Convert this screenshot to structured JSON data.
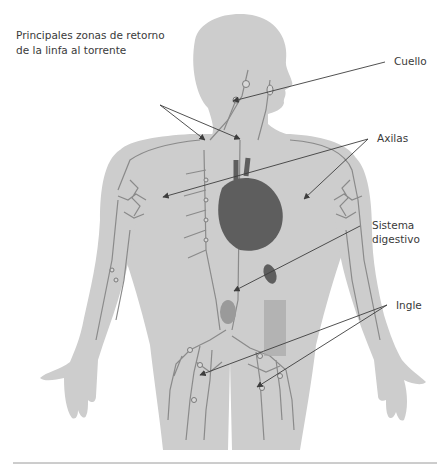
{
  "title": {
    "line1": "Principales zonas de retorno",
    "line2": "de la linfa al torrente"
  },
  "labels": {
    "cuello": "Cuello",
    "axilas": "Axilas",
    "sistema_line1": "Sistema",
    "sistema_line2": "digestivo",
    "ingle": "Ingle"
  },
  "colors": {
    "silhouette": "#cdcdcd",
    "vessel": "#8a8a8a",
    "heart": "#5e5e5e",
    "arrow": "#3d3d3d",
    "text": "#3a3a3a",
    "rule": "#9a9a9a"
  }
}
